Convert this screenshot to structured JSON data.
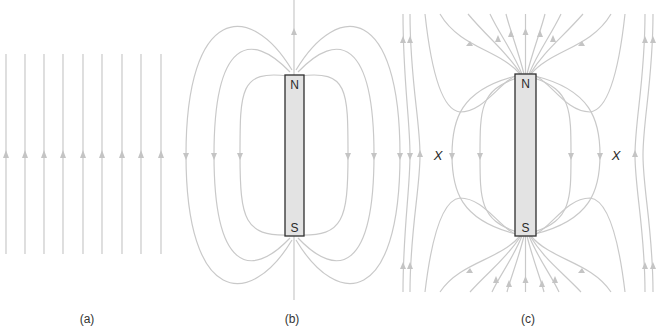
{
  "figure": {
    "colors": {
      "field_line": "#c9c9c9",
      "arrow": "#c4c4c4",
      "magnet_fill": "#e3e3e3",
      "magnet_outline": "#2e2e2e",
      "text": "#2a2a2a"
    },
    "panels": [
      {
        "id": "a",
        "label": "(a)",
        "content": "uniform field",
        "field_line_count": 9,
        "arrow_direction": "up"
      },
      {
        "id": "b",
        "label": "(b)",
        "content": "bar magnet",
        "magnet": {
          "north_label": "N",
          "south_label": "S"
        }
      },
      {
        "id": "c",
        "label": "(c)",
        "content": "bar magnet in uniform field",
        "magnet": {
          "north_label": "N",
          "south_label": "S"
        },
        "neutral_points": [
          {
            "label": "X",
            "side": "left"
          },
          {
            "label": "X",
            "side": "right"
          }
        ]
      }
    ]
  }
}
